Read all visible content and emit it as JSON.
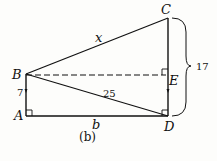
{
  "diagram": {
    "caption": "(b)",
    "points": {
      "A": {
        "label": "A",
        "x": 26,
        "y": 116
      },
      "B": {
        "label": "B",
        "x": 26,
        "y": 74
      },
      "C": {
        "label": "C",
        "x": 168,
        "y": 18
      },
      "D": {
        "label": "D",
        "x": 168,
        "y": 116
      },
      "E": {
        "label": "E",
        "x": 168,
        "y": 76
      }
    },
    "edge_labels": {
      "BC": "x",
      "BD": "25",
      "AB": "7",
      "AD": "b",
      "CD_brace": "17"
    },
    "right_angles": [
      "A",
      "D",
      "E"
    ],
    "dashed": [
      "BE"
    ],
    "stroke_color": "#111111"
  }
}
